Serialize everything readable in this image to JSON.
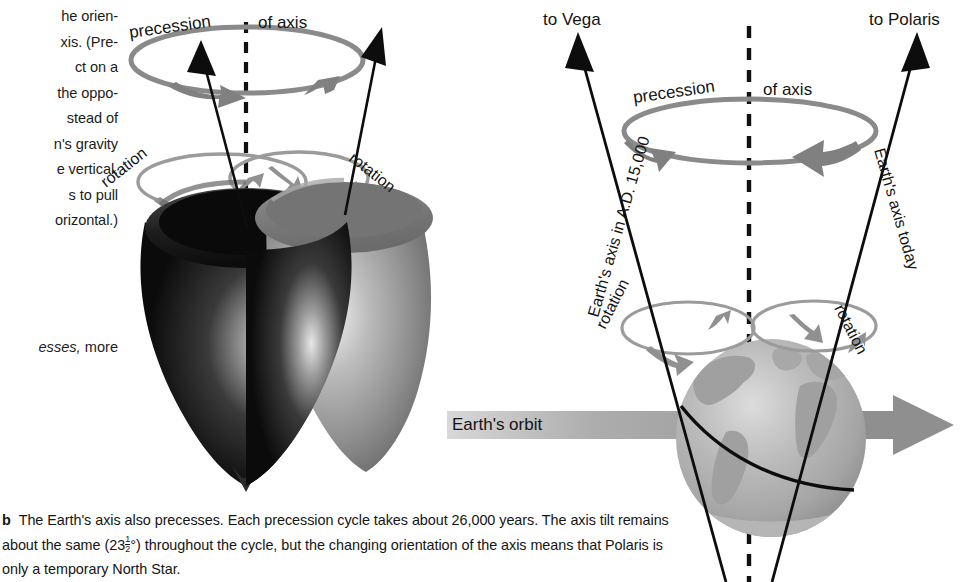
{
  "page": {
    "width": 975,
    "height": 582,
    "background": "#ffffff"
  },
  "colors": {
    "ink": "#141414",
    "gray_arrow": "#808080",
    "gray_ellipse": "#8a8a8a",
    "orbit_band": "#9a9a9a",
    "globe_ocean": "#b9b9b9",
    "globe_land": "#a3a3a3",
    "top_dark": "#161616",
    "top_light": "#8e8e8e"
  },
  "side_column": {
    "clipped_paragraph": "he orien-\nxis. (Pre-\nct on a\nthe oppo-\nstead of\nn's gravity\ne vertical.\ns to pull\norizontal.)",
    "clipped_line_2_italic": "esses,",
    "clipped_line_2_rest": " more"
  },
  "caption": {
    "marker": "b",
    "text_part_1": "The Earth's axis also precesses. Each precession cycle takes about 26,000 years. The axis tilt remains about the same (23",
    "fraction_numerator": "1",
    "fraction_denominator": "2",
    "degree_symbol": "°",
    "text_part_2": ") throughout the cycle, but the changing orientation of the axis means that Polaris is only a temporary North Star."
  },
  "left_diagram": {
    "name": "spinning-tops-precession",
    "labels": {
      "precession": "precession",
      "of_axis": "of axis",
      "rotation_left": "rotation",
      "rotation_right": "rotation"
    }
  },
  "right_diagram": {
    "name": "earth-axis-precession",
    "labels": {
      "to_vega": "to Vega",
      "to_polaris": "to Polaris",
      "precession": "precession",
      "of_axis": "of axis",
      "axis_future": "Earth's axis in A.D. 15,000",
      "axis_today": "Earth's axis today",
      "rotation_left": "rotation",
      "rotation_right": "rotation",
      "orbit": "Earth's orbit"
    }
  }
}
